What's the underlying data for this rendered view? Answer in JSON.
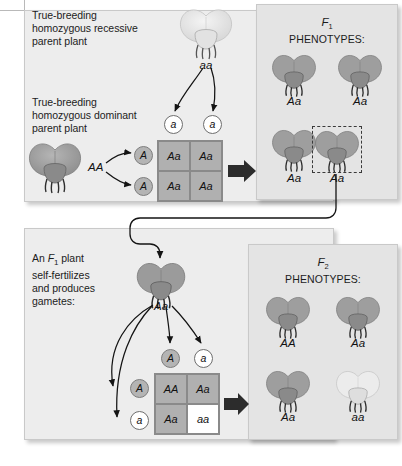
{
  "panel_p": {
    "recessive_caption": "True-breeding\nhomozygous recessive\nparent plant",
    "dominant_caption": "True-breeding\nhomozygous dominant\nparent plant",
    "recessive_genotype": "aa",
    "dominant_genotype": "AA",
    "gametes_top": [
      "a",
      "a"
    ],
    "gametes_left": [
      "A",
      "A"
    ],
    "punnett": {
      "cells": [
        "Aa",
        "Aa",
        "Aa",
        "Aa"
      ],
      "shading": [
        "shade",
        "shade",
        "shade",
        "shade"
      ]
    }
  },
  "panel_f1": {
    "generation_label": "F",
    "generation_sub": "1",
    "phenotypes_label": "PHENOTYPES:",
    "offspring": [
      {
        "genotype": "Aa",
        "flower_color": "purple",
        "highlighted": false
      },
      {
        "genotype": "Aa",
        "flower_color": "purple",
        "highlighted": false
      },
      {
        "genotype": "Aa",
        "flower_color": "purple",
        "highlighted": false
      },
      {
        "genotype": "Aa",
        "flower_color": "purple",
        "highlighted": true
      }
    ]
  },
  "panel_f2gen": {
    "caption": "An F1 plant\nself-fertilizes\nand produces\ngametes:",
    "caption_line1_prefix": "An ",
    "caption_line1_italic": "F",
    "caption_line1_sub": "1",
    "caption_line1_suffix": " plant",
    "caption_line2": "self-fertilizes",
    "caption_line3": "and produces",
    "caption_line4": "gametes:",
    "parent_genotype": "Aa",
    "gametes_top": [
      "A",
      "a"
    ],
    "gametes_left": [
      "A",
      "a"
    ],
    "punnett": {
      "cells": [
        "AA",
        "Aa",
        "Aa",
        "aa"
      ],
      "shading": [
        "shade",
        "shade",
        "shade",
        "white"
      ]
    }
  },
  "panel_f2": {
    "generation_label": "F",
    "generation_sub": "2",
    "phenotypes_label": "PHENOTYPES:",
    "offspring": [
      {
        "genotype": "AA",
        "flower_color": "purple"
      },
      {
        "genotype": "Aa",
        "flower_color": "purple"
      },
      {
        "genotype": "Aa",
        "flower_color": "purple"
      },
      {
        "genotype": "aa",
        "flower_color": "white"
      }
    ]
  },
  "colors": {
    "panel_bg": "#ededed",
    "phenotype_panel_bg": "#e4e4e4",
    "punnett_shaded": "#b0b0b0",
    "punnett_white": "#ffffff",
    "gamete_dominant": "#b4b4b4",
    "gamete_recessive": "#ffffff",
    "arrow_stroke": "#1a1a1a",
    "flower_purple": "#9e9e9e",
    "flower_white": "#e0e0e0",
    "text": "#1c1c1c"
  }
}
